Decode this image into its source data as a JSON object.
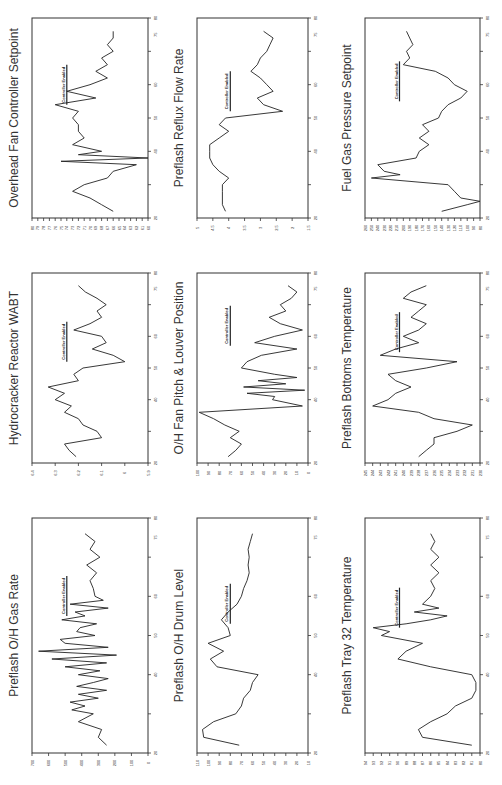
{
  "page": {
    "orientation": "rotated-90",
    "layout": "3x3 grid of line charts"
  },
  "chart_data": [
    {
      "id": "c1",
      "type": "line",
      "title": "Preflash O/H Gas Rate",
      "xlabel": "",
      "ylabel": "",
      "annotation": "Controller Enabled",
      "annotation_x": 55,
      "xlim": [
        20,
        80
      ],
      "xticks": [
        20,
        40,
        50,
        60,
        75,
        80
      ],
      "ylim": [
        0,
        700
      ],
      "yticks": [
        0,
        100,
        200,
        300,
        400,
        500,
        600,
        700
      ],
      "x": [
        22,
        24,
        26,
        28,
        30,
        31,
        32,
        33,
        34,
        35,
        36,
        37,
        38,
        39,
        40,
        41,
        42,
        43,
        44,
        45,
        46,
        47,
        48,
        49,
        50,
        51,
        52,
        53,
        54,
        55,
        56,
        57,
        58,
        59,
        60,
        62,
        64,
        66,
        68,
        70,
        72,
        74,
        76
      ],
      "values": [
        250,
        300,
        280,
        420,
        330,
        460,
        380,
        470,
        300,
        420,
        250,
        430,
        330,
        240,
        420,
        290,
        500,
        250,
        580,
        190,
        660,
        240,
        500,
        530,
        320,
        430,
        410,
        310,
        520,
        380,
        440,
        240,
        470,
        270,
        320,
        330,
        350,
        310,
        370,
        290,
        350,
        320,
        380
      ]
    },
    {
      "id": "c2",
      "type": "line",
      "title": "Preflash O/H Drum Level",
      "xlabel": "",
      "ylabel": "",
      "annotation": "Controller Enabled",
      "annotation_x": 53,
      "xlim": [
        20,
        80
      ],
      "xticks": [
        20,
        40,
        50,
        60,
        75,
        80
      ],
      "ylim": [
        10,
        110
      ],
      "yticks": [
        10,
        20,
        30,
        40,
        50,
        60,
        70,
        80,
        90,
        100,
        110
      ],
      "x": [
        22,
        24,
        26,
        28,
        30,
        32,
        34,
        36,
        38,
        40,
        42,
        44,
        46,
        48,
        50,
        52,
        54,
        56,
        58,
        60,
        62,
        64,
        66,
        68,
        70,
        72,
        74,
        76
      ],
      "values": [
        72,
        104,
        105,
        95,
        75,
        70,
        68,
        62,
        60,
        55,
        92,
        98,
        86,
        100,
        80,
        82,
        88,
        82,
        74,
        70,
        68,
        65,
        63,
        64,
        63,
        64,
        62,
        60
      ]
    },
    {
      "id": "c3",
      "type": "line",
      "title": "Preflash Tray 32 Temperature",
      "xlabel": "",
      "ylabel": "",
      "annotation": "Controller Enabled",
      "annotation_x": 52,
      "xlim": [
        20,
        80
      ],
      "xticks": [
        20,
        40,
        50,
        60,
        75,
        80
      ],
      "ylim": [
        80,
        94
      ],
      "yticks": [
        80,
        81,
        82,
        83,
        84,
        85,
        86,
        87,
        88,
        89,
        90,
        91,
        92,
        93,
        94
      ],
      "x": [
        22,
        24,
        26,
        28,
        30,
        32,
        34,
        36,
        38,
        40,
        42,
        44,
        46,
        48,
        50,
        51,
        52,
        53,
        54,
        55,
        56,
        57,
        58,
        60,
        62,
        64,
        66,
        68,
        70,
        72,
        74,
        76
      ],
      "values": [
        81,
        87,
        87.5,
        86,
        84,
        83,
        81,
        80.5,
        80.5,
        81,
        86,
        90,
        89,
        87,
        92,
        91,
        93,
        89,
        86,
        84,
        88,
        85,
        87,
        86,
        85.5,
        86,
        85,
        86,
        85,
        86,
        85.5,
        86
      ]
    },
    {
      "id": "c4",
      "type": "line",
      "title": "Hydrocracker Reactor WABT",
      "xlabel": "",
      "ylabel": "",
      "annotation": "Controller Enabled",
      "annotation_x": 52,
      "xlim": [
        20,
        80
      ],
      "xticks": [
        20,
        40,
        50,
        60,
        75,
        80
      ],
      "ylim": [
        5.9,
        6.4
      ],
      "yticks": [
        5.9,
        6.0,
        6.1,
        6.2,
        6.3,
        6.4
      ],
      "x": [
        22,
        24,
        26,
        28,
        30,
        32,
        34,
        36,
        38,
        40,
        42,
        44,
        46,
        48,
        50,
        52,
        54,
        56,
        58,
        60,
        62,
        64,
        66,
        68,
        70,
        72,
        74,
        76
      ],
      "values": [
        6.21,
        6.24,
        6.26,
        6.1,
        6.12,
        6.18,
        6.2,
        6.26,
        6.23,
        6.3,
        6.26,
        6.33,
        6.2,
        6.22,
        6.18,
        6.0,
        6.05,
        6.14,
        6.08,
        6.1,
        6.22,
        6.15,
        6.1,
        6.12,
        6.08,
        6.12,
        6.17,
        6.2
      ]
    },
    {
      "id": "c5",
      "type": "line",
      "title": "O/H Fan Pitch & Louver Position",
      "xlabel": "",
      "ylabel": "",
      "annotation": "Controller Enabled",
      "annotation_x": 57,
      "xlim": [
        20,
        80
      ],
      "xticks": [
        20,
        40,
        50,
        60,
        75,
        80
      ],
      "ylim": [
        0,
        100
      ],
      "yticks": [
        0,
        10,
        20,
        30,
        40,
        50,
        60,
        70,
        80,
        90,
        100
      ],
      "x": [
        22,
        24,
        26,
        28,
        30,
        32,
        34,
        36,
        38,
        40,
        41,
        42,
        43,
        44,
        45,
        46,
        47,
        48,
        50,
        52,
        54,
        56,
        58,
        60,
        62,
        64,
        66,
        68,
        70,
        72,
        74,
        76
      ],
      "values": [
        72,
        65,
        60,
        70,
        62,
        75,
        85,
        98,
        5,
        32,
        30,
        55,
        3,
        58,
        20,
        45,
        10,
        30,
        60,
        55,
        42,
        10,
        48,
        30,
        5,
        25,
        35,
        20,
        25,
        15,
        10,
        18
      ]
    },
    {
      "id": "c6",
      "type": "line",
      "title": "Preflash Bottoms Temperature",
      "xlabel": "",
      "ylabel": "",
      "annotation": "Controller Enabled",
      "annotation_x": 55,
      "xlim": [
        20,
        80
      ],
      "xticks": [
        20,
        40,
        50,
        60,
        75,
        80
      ],
      "ylim": [
        230,
        245
      ],
      "yticks": [
        230,
        231,
        232,
        233,
        234,
        235,
        236,
        237,
        238,
        239,
        240,
        241,
        242,
        243,
        244,
        245
      ],
      "x": [
        22,
        24,
        26,
        28,
        30,
        32,
        34,
        36,
        38,
        40,
        42,
        44,
        46,
        48,
        50,
        52,
        54,
        56,
        58,
        60,
        62,
        64,
        66,
        68,
        70,
        72,
        74,
        76
      ],
      "values": [
        238,
        237,
        236,
        236,
        233,
        231,
        236,
        238,
        244,
        242,
        241,
        239,
        241,
        242,
        237,
        233,
        243,
        241,
        238,
        240,
        238,
        237,
        239,
        238,
        237,
        240,
        239,
        237
      ]
    },
    {
      "id": "c7",
      "type": "line",
      "title": "Overhead Fan Controller Setpoint",
      "xlabel": "",
      "ylabel": "",
      "annotation": "Controller Enabled",
      "annotation_x": 54,
      "xlim": [
        20,
        80
      ],
      "xticks": [
        20,
        40,
        50,
        60,
        75,
        80
      ],
      "ylim": [
        60,
        80
      ],
      "yticks": [
        60,
        61,
        62,
        63,
        64,
        65,
        66,
        67,
        68,
        69,
        70,
        71,
        72,
        73,
        74,
        75,
        76,
        77,
        78,
        79,
        80
      ],
      "x": [
        22,
        24,
        26,
        28,
        30,
        32,
        34,
        36,
        37,
        38,
        39,
        40,
        42,
        44,
        46,
        48,
        50,
        52,
        54,
        56,
        58,
        60,
        62,
        64,
        66,
        68,
        70,
        72,
        74,
        76
      ],
      "values": [
        66,
        68,
        70,
        73,
        71,
        67,
        66,
        62,
        75,
        60,
        72,
        68,
        73,
        71,
        72,
        72,
        73,
        72,
        76,
        69,
        74,
        70,
        67,
        69,
        67,
        68,
        66,
        67,
        66,
        66
      ]
    },
    {
      "id": "c8",
      "type": "line",
      "title": "Preflash Reflux Flow Rate",
      "xlabel": "",
      "ylabel": "",
      "annotation": "Controller Enabled",
      "annotation_x": 52,
      "xlim": [
        20,
        80
      ],
      "xticks": [
        20,
        40,
        50,
        60,
        75,
        80
      ],
      "ylim": [
        1.5,
        5
      ],
      "yticks": [
        1.5,
        2,
        2.5,
        3,
        3.5,
        4,
        4.5,
        5
      ],
      "x": [
        22,
        24,
        26,
        28,
        30,
        32,
        34,
        36,
        38,
        40,
        42,
        44,
        46,
        48,
        50,
        52,
        54,
        56,
        58,
        60,
        62,
        64,
        66,
        68,
        70,
        72,
        74,
        76
      ],
      "values": [
        4.1,
        4.2,
        4.2,
        4.2,
        4.2,
        4.0,
        4.3,
        4.5,
        4.6,
        4.6,
        4.6,
        4.3,
        4.0,
        4.3,
        4.1,
        2.3,
        2.9,
        3.1,
        2.6,
        2.8,
        3.0,
        3.3,
        3.1,
        3.0,
        2.8,
        2.7,
        2.6,
        2.9
      ]
    },
    {
      "id": "c9",
      "type": "line",
      "title": "Fuel Gas Pressure Setpoint",
      "xlabel": "",
      "ylabel": "",
      "annotation": "Controller Enabled",
      "annotation_x": 55,
      "xlim": [
        20,
        80
      ],
      "xticks": [
        20,
        40,
        50,
        60,
        75,
        80
      ],
      "ylim": [
        80,
        260
      ],
      "yticks": [
        80,
        90,
        100,
        110,
        120,
        130,
        140,
        150,
        160,
        170,
        180,
        190,
        200,
        210,
        220,
        230,
        240,
        250,
        260
      ],
      "x": [
        22,
        24,
        25,
        26,
        28,
        30,
        32,
        33,
        34,
        36,
        38,
        40,
        42,
        44,
        46,
        48,
        50,
        52,
        54,
        56,
        58,
        60,
        62,
        64,
        66,
        68,
        70,
        72,
        74,
        76
      ],
      "values": [
        140,
        100,
        80,
        110,
        120,
        130,
        250,
        205,
        230,
        240,
        180,
        175,
        160,
        175,
        160,
        170,
        145,
        140,
        130,
        110,
        100,
        120,
        130,
        150,
        200,
        190,
        195,
        185,
        190,
        195
      ]
    }
  ]
}
